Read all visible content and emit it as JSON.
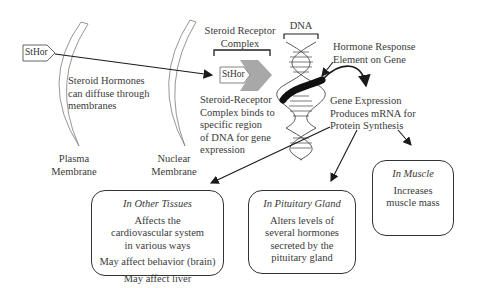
{
  "hormone_tag": "StHor",
  "hormone_tag_inner": "StHor",
  "membranes": {
    "plasma": [
      "Plasma",
      "Membrane"
    ],
    "nuclear": [
      "Nuclear",
      "Membrane"
    ]
  },
  "diffuse_text": [
    "Steroid Hormones",
    "can diffuse through",
    "membranes"
  ],
  "receptor_complex_label": [
    "Steroid Receptor",
    "Complex"
  ],
  "dna_label": "DNA",
  "binding_text": [
    "Steroid-Receptor",
    "Complex binds to",
    "specific region",
    "of DNA for gene",
    "expression"
  ],
  "hre_text": [
    "Hormone Response",
    "Element on Gene"
  ],
  "gene_expression_text": [
    "Gene Expression",
    "Produces mRNA for",
    "Protein Synthesis"
  ],
  "boxes": {
    "other_tissues": {
      "title": "In Other Tissues",
      "lines": [
        "Affects the cardiovascular system in various ways",
        "May affect behavior (brain)",
        "May affect liver"
      ]
    },
    "pituitary": {
      "title": "In Pituitary Gland",
      "lines": [
        "Alters levels of several hormones secreted by the pituitary gland"
      ]
    },
    "muscle": {
      "title": "In Muscle",
      "lines": [
        "Increases muscle mass"
      ]
    }
  },
  "colors": {
    "ink": "#1a1a1a",
    "text": "#3a3a3a",
    "receptor_gray": "#a8a8a8",
    "membrane": "#8a8a8a"
  }
}
